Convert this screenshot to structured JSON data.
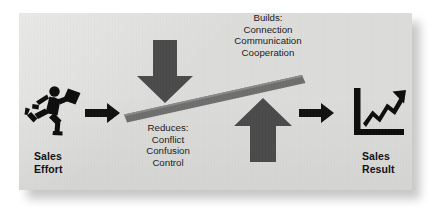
{
  "diagram": {
    "panel_color": "#dcdcdb",
    "accent_color": "#4a4a4a",
    "beam_color": "#6e6e6e",
    "ink_color": "#111111",
    "left_endpoint": {
      "icon": "running-businessman-icon",
      "label": "Sales\nEffort"
    },
    "right_endpoint": {
      "icon": "rising-chart-icon",
      "label": "Sales\nResult"
    },
    "flow_arrows": [
      {
        "icon": "arrow-right-icon",
        "order": 1
      },
      {
        "icon": "arrow-right-icon",
        "order": 2
      }
    ],
    "down_arrow": {
      "icon": "arrow-down-block-icon",
      "note_heading": "Reduces:",
      "note_items": [
        "Conflict",
        "Confusion",
        "Control"
      ],
      "note_text": "Reduces:\nConflict\nConfusion\nControl"
    },
    "up_arrow": {
      "icon": "arrow-up-block-icon",
      "note_heading": "Builds:",
      "note_items": [
        "Connection",
        "Communication",
        "Cooperation"
      ],
      "note_text": "Builds:\nConnection\nCommunication\nCooperation"
    },
    "beam": {
      "icon": "tilted-beam-shape",
      "description": "upward tilting bar"
    }
  }
}
